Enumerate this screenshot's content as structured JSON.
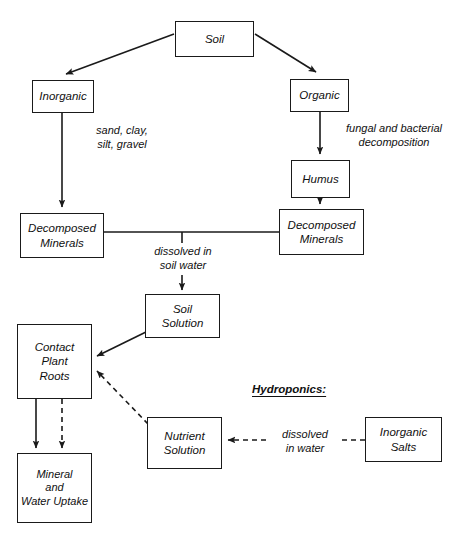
{
  "diagram": {
    "stroke_color": "#1a1a1a",
    "text_color": "#101010",
    "background_color": "#ffffff",
    "nodes": [
      {
        "id": "soil",
        "label": "Soil",
        "x": 175,
        "y": 21,
        "w": 79,
        "h": 36
      },
      {
        "id": "inorganic",
        "label": "Inorganic",
        "x": 32,
        "y": 80,
        "w": 62,
        "h": 33
      },
      {
        "id": "organic",
        "label": "Organic",
        "x": 290,
        "y": 79,
        "w": 59,
        "h": 33
      },
      {
        "id": "humus",
        "label": "Humus",
        "x": 291,
        "y": 160,
        "w": 59,
        "h": 38
      },
      {
        "id": "decomposed-right",
        "label": "Decomposed\nMinerals",
        "x": 279,
        "y": 209,
        "w": 85,
        "h": 46
      },
      {
        "id": "decomposed-left",
        "label": "Decomposed\nMinerals",
        "x": 20,
        "y": 213,
        "w": 84,
        "h": 45
      },
      {
        "id": "soil-solution",
        "label": "Soil\nSolution",
        "x": 145,
        "y": 294,
        "w": 75,
        "h": 44
      },
      {
        "id": "contact-roots",
        "label": "Contact\nPlant\nRoots",
        "x": 17,
        "y": 324,
        "w": 75,
        "h": 75
      },
      {
        "id": "mineral-uptake",
        "label": "Mineral\nand\nWater Uptake",
        "x": 17,
        "y": 453,
        "w": 75,
        "h": 70
      },
      {
        "id": "nutrient-solution",
        "label": "Nutrient\nSolution",
        "x": 147,
        "y": 417,
        "w": 75,
        "h": 52
      },
      {
        "id": "inorganic-salts",
        "label": "Inorganic\nSalts",
        "x": 365,
        "y": 417,
        "w": 77,
        "h": 45
      }
    ],
    "edge_labels": [
      {
        "id": "sand-clay",
        "text": "sand, clay,\nsilt, gravel",
        "x": 74,
        "y": 124,
        "w": 96
      },
      {
        "id": "fungal-decomposition",
        "text": "fungal and bacterial\ndecomposition",
        "x": 330,
        "y": 122,
        "w": 128
      },
      {
        "id": "dissolved-soil-water",
        "text": "dissolved in\nsoil water",
        "x": 143,
        "y": 245,
        "w": 80
      },
      {
        "id": "dissolved-in-water",
        "text": "dissolved\nin water",
        "x": 270,
        "y": 428,
        "w": 70
      }
    ],
    "section_labels": [
      {
        "id": "hydroponics",
        "text": "Hydroponics:",
        "x": 252,
        "y": 383
      }
    ],
    "edges": [
      {
        "id": "soil-to-inorganic",
        "from": "soil",
        "to": "inorganic",
        "style": "solid",
        "arrow": true
      },
      {
        "id": "soil-to-organic",
        "from": "soil",
        "to": "organic",
        "style": "solid",
        "arrow": true
      },
      {
        "id": "inorganic-to-decomposed-left",
        "from": "inorganic",
        "to": "decomposed-left",
        "style": "solid",
        "arrow": true
      },
      {
        "id": "organic-to-humus",
        "from": "organic",
        "to": "humus",
        "style": "solid",
        "arrow": true
      },
      {
        "id": "humus-to-decomposed-right",
        "from": "humus",
        "to": "decomposed-right",
        "style": "solid",
        "arrow": true
      },
      {
        "id": "decomposed-link",
        "from": "decomposed-left",
        "to": "decomposed-right",
        "style": "solid",
        "arrow": false
      },
      {
        "id": "dissolved-to-soil-solution",
        "from": "decomposed-link",
        "to": "soil-solution",
        "style": "solid",
        "arrow": true
      },
      {
        "id": "soil-solution-to-roots",
        "from": "soil-solution",
        "to": "contact-roots",
        "style": "solid",
        "arrow": true
      },
      {
        "id": "nutrient-solution-to-roots",
        "from": "nutrient-solution",
        "to": "contact-roots",
        "style": "dashed",
        "arrow": true
      },
      {
        "id": "roots-to-uptake-solid",
        "from": "contact-roots",
        "to": "mineral-uptake",
        "style": "solid",
        "arrow": true
      },
      {
        "id": "roots-to-uptake-dashed",
        "from": "contact-roots",
        "to": "mineral-uptake",
        "style": "dashed",
        "arrow": true
      },
      {
        "id": "salts-to-nutrient-solution",
        "from": "inorganic-salts",
        "to": "nutrient-solution",
        "style": "dashed",
        "arrow": true
      }
    ]
  }
}
